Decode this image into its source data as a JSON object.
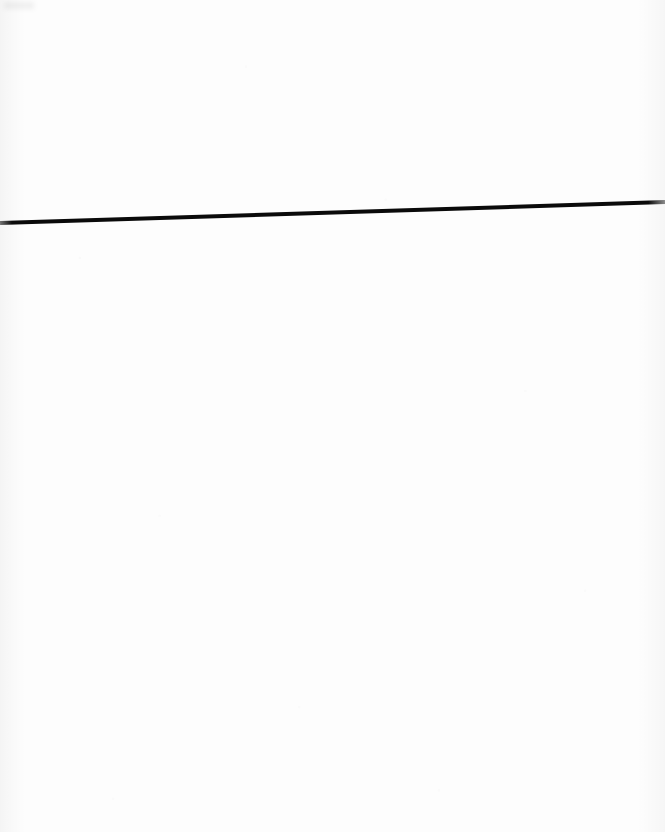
{
  "page": {
    "label": "Scanned blank page with single ruled line",
    "width": 665,
    "height": 832,
    "background_color": "#fdfdfd",
    "paper_tone": "near-white scanned paper with faint speckle noise",
    "text_content": "",
    "has_text": false
  },
  "marks": {
    "rule_line": {
      "label": "horizontal ruled line",
      "color": "#0a0a0a",
      "thickness_px": 4,
      "start_x": 0,
      "start_y": 223,
      "end_x": 665,
      "end_y": 202,
      "orientation": "near-horizontal, sloping slightly upward to the right",
      "tapered_ends": true
    }
  },
  "artifacts": {
    "left_edge_shadow": {
      "label": "faint vertical scan shadow along left edge",
      "color": "#000000",
      "opacity": 0.035,
      "width_px": 26
    },
    "right_edge_shadow": {
      "label": "faint vertical scan shadow along right edge",
      "color": "#000000",
      "opacity": 0.028,
      "width_px": 30
    },
    "corner_smudge": {
      "label": "faint smudge at top-left corner",
      "color": "#000000",
      "opacity": 0.055
    }
  }
}
